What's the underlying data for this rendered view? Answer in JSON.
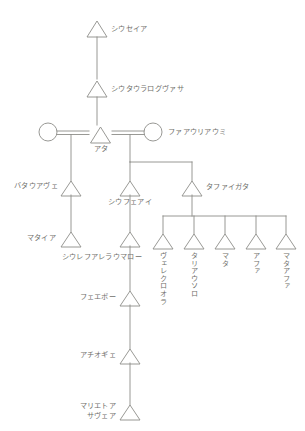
{
  "diagram": {
    "style": {
      "line_color": "#8a8a86",
      "text_color": "#6f6f6b",
      "background": "#ffffff",
      "male_symbol": "triangle",
      "female_symbol": "circle",
      "marriage_symbol": "double-horizontal-bar"
    },
    "generations": [
      {
        "index": 1,
        "persons": [
          {
            "id": "p1",
            "name": "シウセイア",
            "symbol": "triangle",
            "sex": "male"
          }
        ]
      },
      {
        "index": 2,
        "persons": [
          {
            "id": "p2",
            "name": "シウタウラログヴァサ",
            "symbol": "triangle",
            "sex": "male"
          }
        ]
      },
      {
        "index": 3,
        "persons": [
          {
            "id": "p3",
            "name": "",
            "symbol": "circle",
            "sex": "female"
          },
          {
            "id": "p4",
            "name": "アタ",
            "symbol": "triangle",
            "sex": "male"
          },
          {
            "id": "p5",
            "name": "ファアウリアウミ",
            "symbol": "circle",
            "sex": "female"
          }
        ]
      },
      {
        "index": 4,
        "persons": [
          {
            "id": "p6",
            "name": "バタウアヴェ",
            "symbol": "triangle",
            "sex": "male"
          },
          {
            "id": "p7",
            "name": "シウフェアイ",
            "symbol": "triangle",
            "sex": "male"
          },
          {
            "id": "p8",
            "name": "タファイガタ",
            "symbol": "triangle",
            "sex": "male"
          }
        ]
      },
      {
        "index": 5,
        "persons": [
          {
            "id": "p9",
            "name": "マタイア",
            "symbol": "triangle",
            "sex": "male"
          },
          {
            "id": "p10",
            "name": "シウレフアレラウマロー",
            "symbol": "triangle",
            "sex": "male"
          },
          {
            "id": "p11",
            "name": "ヴェレクロオラ",
            "symbol": "triangle",
            "sex": "male",
            "orientation": "vertical"
          },
          {
            "id": "p12",
            "name": "タリアウソロ",
            "symbol": "triangle",
            "sex": "male",
            "orientation": "vertical"
          },
          {
            "id": "p13",
            "name": "マタ",
            "symbol": "triangle",
            "sex": "male",
            "orientation": "vertical"
          },
          {
            "id": "p14",
            "name": "アファ",
            "symbol": "triangle",
            "sex": "male",
            "orientation": "vertical"
          },
          {
            "id": "p15",
            "name": "マタアファ",
            "symbol": "triangle",
            "sex": "male",
            "orientation": "vertical"
          }
        ]
      },
      {
        "index": 6,
        "persons": [
          {
            "id": "p16",
            "name": "フェエボー",
            "symbol": "triangle",
            "sex": "male"
          }
        ]
      },
      {
        "index": 7,
        "persons": [
          {
            "id": "p17",
            "name": "アチオギェ",
            "symbol": "triangle",
            "sex": "male"
          }
        ]
      },
      {
        "index": 8,
        "persons": [
          {
            "id": "p18",
            "name_line1": "マリエトア",
            "name_line2": "サヴェア",
            "symbol": "triangle",
            "sex": "male"
          }
        ]
      }
    ],
    "labels": {
      "n1": "シウセイア",
      "n2": "シウタウラログヴァサ",
      "n4": "アタ",
      "n5": "ファアウリアウミ",
      "n6": "バタウアヴェ",
      "n7": "シウフェアイ",
      "n8": "タファイガタ",
      "n9": "マタイア",
      "n10": "シウレフアレラウマロー",
      "n11": "ヴェレクロオラ",
      "n12": "タリアウソロ",
      "n13": "マタ",
      "n14": "アファ",
      "n15": "マタアファ",
      "n16": "フェエボー",
      "n17": "アチオギェ",
      "n18_line1": "マリエトア",
      "n18_line2": "サヴェア"
    }
  }
}
